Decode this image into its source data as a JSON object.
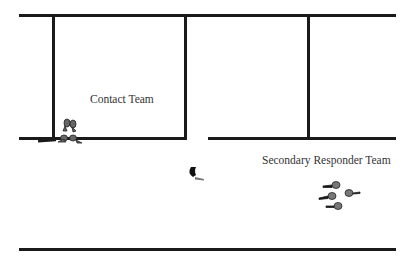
{
  "diagram": {
    "type": "floor-plan-tactical",
    "labels": {
      "contact_team": "Contact Team",
      "secondary_team": "Secondary Responder Team"
    },
    "teams": [
      {
        "name": "Contact Team",
        "member_count": 4,
        "position": "doorway lower-left of room"
      },
      {
        "name": "Secondary Responder Team",
        "member_count": 4,
        "position": "right hallway"
      }
    ],
    "subjects": [
      {
        "name": "lone figure",
        "position": "hallway center"
      }
    ],
    "colors": {
      "walls": "#1a1a1a",
      "text": "#333333",
      "background": "#ffffff"
    }
  }
}
